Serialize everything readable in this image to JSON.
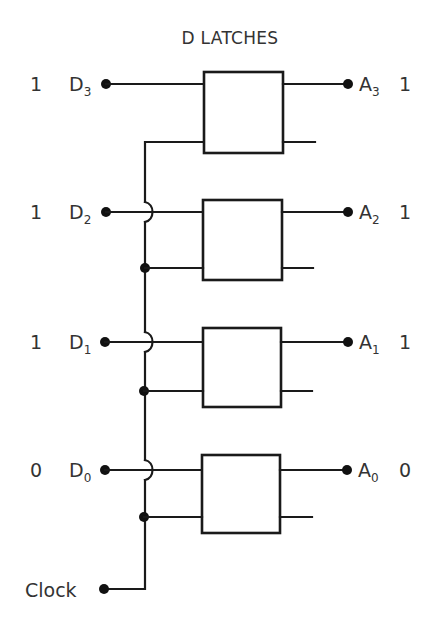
{
  "title": "D LATCHES",
  "clock": {
    "label": "Clock"
  },
  "latches": [
    {
      "input": {
        "letter": "D",
        "sub": "3",
        "value": "1"
      },
      "output": {
        "letter": "A",
        "sub": "3",
        "value": "1"
      }
    },
    {
      "input": {
        "letter": "D",
        "sub": "2",
        "value": "1"
      },
      "output": {
        "letter": "A",
        "sub": "2",
        "value": "1"
      }
    },
    {
      "input": {
        "letter": "D",
        "sub": "1",
        "value": "1"
      },
      "output": {
        "letter": "A",
        "sub": "1",
        "value": "1"
      }
    },
    {
      "input": {
        "letter": "D",
        "sub": "0",
        "value": "0"
      },
      "output": {
        "letter": "A",
        "sub": "0",
        "value": "0"
      }
    }
  ],
  "colors": {
    "stroke": "#1a1a1a",
    "text": "#333333",
    "background": "#ffffff"
  }
}
